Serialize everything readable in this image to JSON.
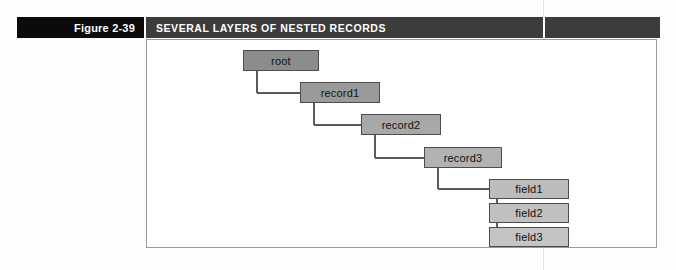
{
  "figure": {
    "label": "Figure 2-39",
    "caption": "SEVERAL LAYERS OF NESTED RECORDS"
  },
  "colors": {
    "figure_tab_bg": "#0b0b0b",
    "caption_bg": "#3c3c3c",
    "caption_fg": "#ffffff",
    "frame_border": "#9a9a9a",
    "node_border": "#4d4d4d",
    "connector": "#5a5a5a",
    "page_bg": "#fdfdfd",
    "gutter_line": "#e3e3e3"
  },
  "diagram": {
    "type": "tree",
    "nodes": [
      {
        "id": "root",
        "label": "root",
        "x": 243,
        "y": 50,
        "w": 76,
        "h": 21,
        "fill": "#8c8c8c",
        "depth": 0
      },
      {
        "id": "record1",
        "label": "record1",
        "x": 300,
        "y": 82,
        "w": 80,
        "h": 21,
        "fill": "#9a9a9a",
        "depth": 1
      },
      {
        "id": "record2",
        "label": "record2",
        "x": 361,
        "y": 114,
        "w": 80,
        "h": 21,
        "fill": "#a8a8a8",
        "depth": 2
      },
      {
        "id": "record3",
        "label": "record3",
        "x": 424,
        "y": 147,
        "w": 78,
        "h": 21,
        "fill": "#b2b2b2",
        "depth": 3
      },
      {
        "id": "field1",
        "label": "field1",
        "x": 489,
        "y": 179,
        "w": 80,
        "h": 20,
        "fill": "#bcbcbc",
        "depth": 4
      },
      {
        "id": "field2",
        "label": "field2",
        "x": 489,
        "y": 203,
        "w": 80,
        "h": 20,
        "fill": "#c0c0c0",
        "depth": 4
      },
      {
        "id": "field3",
        "label": "field3",
        "x": 489,
        "y": 227,
        "w": 80,
        "h": 20,
        "fill": "#c4c4c4",
        "depth": 4
      }
    ],
    "edges": [
      {
        "from": "root",
        "to": "record1"
      },
      {
        "from": "record1",
        "to": "record2"
      },
      {
        "from": "record2",
        "to": "record3"
      },
      {
        "from": "record3",
        "to": "field1"
      },
      {
        "from": "field1",
        "to": "field2"
      },
      {
        "from": "field2",
        "to": "field3"
      }
    ]
  }
}
